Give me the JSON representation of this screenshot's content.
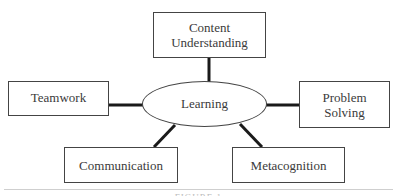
{
  "diagram": {
    "center": {
      "label": "Learning"
    },
    "nodes": [
      {
        "id": "content-understanding",
        "label_line1": "Content",
        "label_line2": "Understanding"
      },
      {
        "id": "teamwork",
        "label_line1": "Teamwork",
        "label_line2": ""
      },
      {
        "id": "problem-solving",
        "label_line1": "Problem",
        "label_line2": "Solving"
      },
      {
        "id": "communication",
        "label_line1": "Communication",
        "label_line2": ""
      },
      {
        "id": "metacognition",
        "label_line1": "Metacognition",
        "label_line2": ""
      }
    ],
    "caption": "FIGURE 1",
    "colors": {
      "line": "#1a1a1a",
      "border": "#444444",
      "text": "#3a3a3a",
      "rule": "#cfcfcf"
    }
  }
}
